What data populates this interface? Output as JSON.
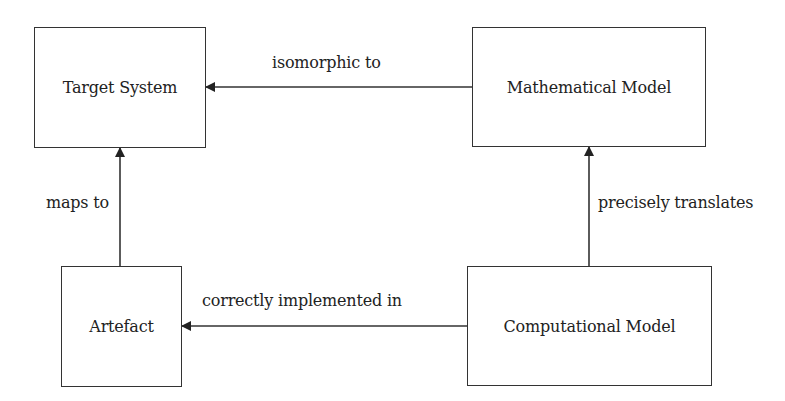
{
  "diagram": {
    "nodes": {
      "target_system": "Target System",
      "mathematical_model": "Mathematical Model",
      "artefact": "Artefact",
      "computational_model": "Computational Model"
    },
    "edges": {
      "isomorphic_to": "isomorphic to",
      "maps_to": "maps to",
      "precisely_translates": "precisely translates",
      "correctly_implemented_in": "correctly implemented in"
    },
    "colors": {
      "stroke": "#333333",
      "text": "#222222",
      "background": "#ffffff"
    }
  }
}
